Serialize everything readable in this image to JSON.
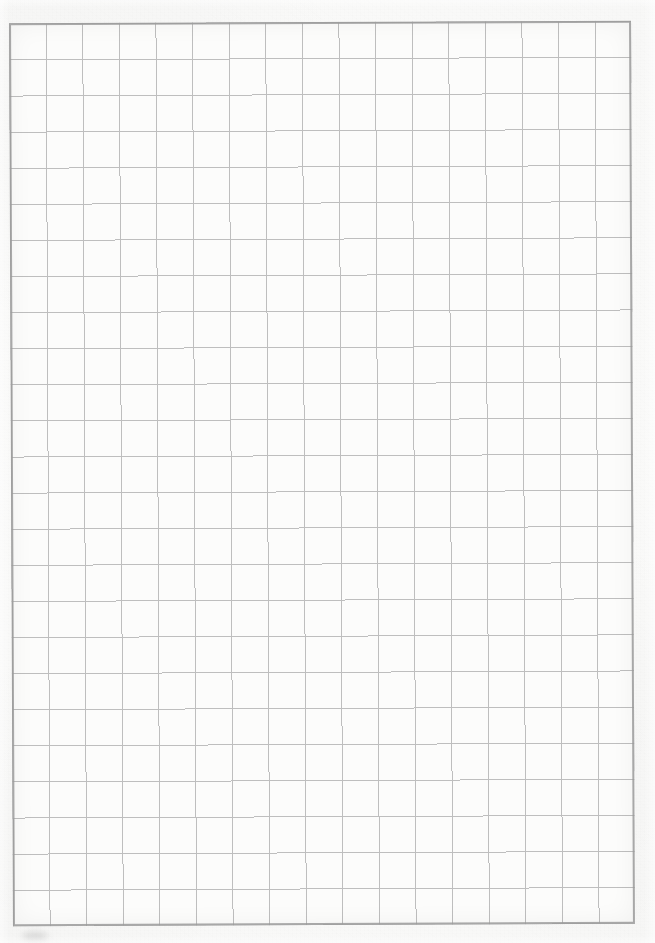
{
  "document": {
    "kind": "scanned-grid-paper",
    "title": "Blank graph paper scan",
    "page_width": 655,
    "page_height": 943,
    "has_text": false,
    "text_content": ""
  },
  "paper": {
    "background_color": "#fafaf9",
    "tone_light": "#fdfdfc",
    "tone_dark": "#ededec",
    "texture_opacity": 0.55
  },
  "grid": {
    "columns": 17,
    "rows": 25,
    "cell_width": 36.6,
    "cell_height": 36.1,
    "left": 11,
    "top": 22,
    "width": 622,
    "height": 903,
    "rotation_deg": -0.25,
    "line_color": "#b9b9b9",
    "line_width_px": 1,
    "border_color": "#9a9a9a",
    "border_width_px": 2,
    "cell_fill": "#fcfcfb",
    "inner_shadow_color": "rgba(0,0,0,0.05)"
  },
  "artifacts": {
    "smudge": {
      "label": "faint-scan-smudge",
      "left": 22,
      "top": 932,
      "width": 26,
      "height": 9,
      "color": "rgba(120,120,120,0.22)",
      "blur_px": 3
    }
  }
}
